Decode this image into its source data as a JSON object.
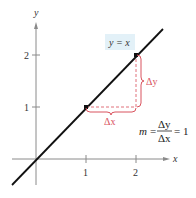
{
  "diagram": {
    "type": "coordinate-graph",
    "axes": {
      "x_label": "x",
      "y_label": "y"
    },
    "x_ticks": [
      "1",
      "2"
    ],
    "y_ticks": [
      "1",
      "2"
    ],
    "line": {
      "equation": "y = x"
    },
    "points": [
      {
        "x": 1,
        "y": 1
      },
      {
        "x": 2,
        "y": 2
      }
    ],
    "delta_x_label": "Δx",
    "delta_y_label": "Δy",
    "slope": {
      "m": "m",
      "equals": "=",
      "numerator": "Δy",
      "denominator": "Δx",
      "result": "= 1"
    },
    "colors": {
      "line": "#111111",
      "axis": "#8a8a8a",
      "accent_red": "#d9535e",
      "label_highlight": "#e3f1f8"
    }
  }
}
